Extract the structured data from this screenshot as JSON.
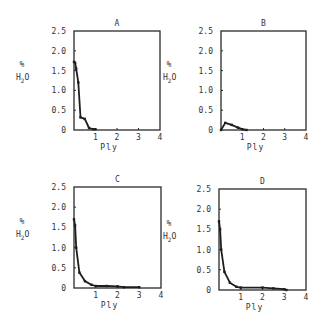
{
  "chart_data": [
    {
      "type": "line",
      "title": "A",
      "xlabel": "Ply",
      "ylabel": "% H2O",
      "xlim": [
        0,
        4
      ],
      "ylim": [
        0,
        2.5
      ],
      "xticks": [
        "1",
        "2",
        "3",
        "4"
      ],
      "yticks": [
        "0",
        "0.5",
        "1.0",
        "1.5",
        "2.0",
        "2.5"
      ],
      "grid": false,
      "x": [
        0,
        0.05,
        0.1,
        0.2,
        0.3,
        0.5,
        0.7,
        0.9,
        1.0
      ],
      "y": [
        1.72,
        1.7,
        1.55,
        1.2,
        0.32,
        0.28,
        0.05,
        0.02,
        0.02
      ]
    },
    {
      "type": "line",
      "title": "B",
      "xlabel": "Ply",
      "ylabel": "% H2O",
      "xlim": [
        0,
        4
      ],
      "ylim": [
        0,
        2.5
      ],
      "xticks": [
        "1",
        "2",
        "3",
        "4"
      ],
      "yticks": [
        "0",
        "0.5",
        "1.0",
        "1.5",
        "2.0",
        "2.5"
      ],
      "grid": false,
      "x": [
        0,
        0.2,
        0.5,
        0.8,
        1.0,
        1.2
      ],
      "y": [
        0,
        0.18,
        0.13,
        0.06,
        0.02,
        0.0
      ]
    },
    {
      "type": "line",
      "title": "C",
      "xlabel": "Ply",
      "ylabel": "% H2O",
      "xlim": [
        0,
        4
      ],
      "ylim": [
        0,
        2.5
      ],
      "xticks": [
        "1",
        "2",
        "3",
        "4"
      ],
      "yticks": [
        "0",
        "0.5",
        "1.0",
        "1.5",
        "2.0",
        "2.5"
      ],
      "grid": false,
      "x": [
        0,
        0.05,
        0.1,
        0.25,
        0.5,
        0.8,
        1.0,
        1.5,
        2.0,
        2.3,
        3.0
      ],
      "y": [
        1.7,
        1.55,
        1.0,
        0.38,
        0.17,
        0.08,
        0.05,
        0.05,
        0.04,
        0.02,
        0.02
      ]
    },
    {
      "type": "line",
      "title": "D",
      "xlabel": "Ply",
      "ylabel": "% H2O",
      "xlim": [
        0,
        4
      ],
      "ylim": [
        0,
        2.5
      ],
      "xticks": [
        "1",
        "2",
        "3",
        "4"
      ],
      "yticks": [
        "0",
        "0.5",
        "1.0",
        "1.5",
        "2.0",
        "2.5"
      ],
      "grid": false,
      "x": [
        0,
        0.05,
        0.1,
        0.25,
        0.5,
        0.8,
        1.0,
        2.0,
        2.5,
        3.0,
        3.1
      ],
      "y": [
        1.7,
        1.5,
        1.0,
        0.45,
        0.18,
        0.08,
        0.06,
        0.06,
        0.04,
        0.02,
        0.0
      ]
    }
  ],
  "labels": {
    "percent": "%",
    "h2o_h": "H",
    "h2o_sub": "2",
    "h2o_o": "O"
  }
}
